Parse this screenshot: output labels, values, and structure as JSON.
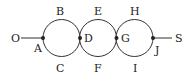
{
  "diagram": {
    "type": "circuit-of-three-tangent-circles",
    "colors": {
      "stroke": "#333333",
      "text": "#222222",
      "background": "#ffffff"
    },
    "endpoints": [
      {
        "id": "O",
        "label": "O",
        "x": 15,
        "y": 42
      },
      {
        "id": "S",
        "label": "S",
        "x": 179,
        "y": 42
      }
    ],
    "nodes": [
      {
        "id": "A",
        "label": "A",
        "x": 43,
        "y": 38
      },
      {
        "id": "D",
        "label": "D",
        "x": 80,
        "y": 38
      },
      {
        "id": "G",
        "label": "G",
        "x": 116,
        "y": 38
      },
      {
        "id": "J",
        "label": "J",
        "x": 153,
        "y": 38
      }
    ],
    "circles": [
      {
        "id": "circle-1",
        "cx": 61.5,
        "cy": 38,
        "r": 18.5,
        "top_label": "B",
        "bottom_label": "C"
      },
      {
        "id": "circle-2",
        "cx": 98,
        "cy": 38,
        "r": 18.5,
        "top_label": "E",
        "bottom_label": "F"
      },
      {
        "id": "circle-3",
        "cx": 134.5,
        "cy": 38,
        "r": 18.5,
        "top_label": "H",
        "bottom_label": "I"
      }
    ],
    "labels": {
      "O": "O",
      "A": "A",
      "B": "B",
      "C": "C",
      "D": "D",
      "E": "E",
      "F": "F",
      "G": "G",
      "H": "H",
      "I": "I",
      "J": "J",
      "S": "S"
    }
  }
}
